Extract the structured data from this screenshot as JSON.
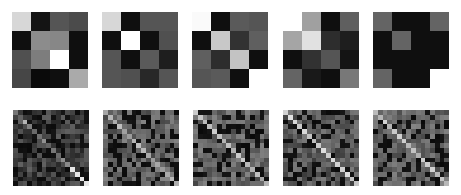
{
  "figure": {
    "background": "#ffffff",
    "colormap": "grayscale (0=black, 255=white)"
  },
  "chart_data": [
    {
      "type": "heatmap",
      "row": "top",
      "index": 0,
      "size": 4,
      "values": [
        [
          215,
          20,
          85,
          75
        ],
        [
          15,
          140,
          135,
          15
        ],
        [
          80,
          125,
          255,
          15
        ],
        [
          70,
          10,
          15,
          170
        ]
      ]
    },
    {
      "type": "heatmap",
      "row": "top",
      "index": 1,
      "size": 4,
      "values": [
        [
          215,
          15,
          85,
          85
        ],
        [
          15,
          255,
          15,
          80
        ],
        [
          85,
          15,
          90,
          30
        ],
        [
          85,
          80,
          40,
          85
        ]
      ]
    },
    {
      "type": "heatmap",
      "row": "top",
      "index": 2,
      "size": 4,
      "values": [
        [
          250,
          15,
          90,
          85
        ],
        [
          15,
          200,
          50,
          95
        ],
        [
          95,
          45,
          195,
          15
        ],
        [
          85,
          90,
          15,
          255
        ]
      ]
    },
    {
      "type": "heatmap",
      "row": "top",
      "index": 3,
      "size": 4,
      "values": [
        [
          255,
          160,
          15,
          95
        ],
        [
          165,
          225,
          45,
          30
        ],
        [
          15,
          50,
          85,
          20
        ],
        [
          100,
          25,
          15,
          120
        ]
      ]
    },
    {
      "type": "heatmap",
      "row": "top",
      "index": 4,
      "size": 4,
      "values": [
        [
          100,
          15,
          15,
          100
        ],
        [
          15,
          100,
          15,
          15
        ],
        [
          15,
          15,
          15,
          15
        ],
        [
          100,
          15,
          15,
          255
        ]
      ]
    },
    {
      "type": "heatmap",
      "row": "bottom",
      "index": 0,
      "size": 16,
      "diagonal_brightness": "weak-to-strong toward bottom-right"
    },
    {
      "type": "heatmap",
      "row": "bottom",
      "index": 1,
      "size": 16,
      "diagonal_brightness": "moderate"
    },
    {
      "type": "heatmap",
      "row": "bottom",
      "index": 2,
      "size": 16,
      "diagonal_brightness": "moderate"
    },
    {
      "type": "heatmap",
      "row": "bottom",
      "index": 3,
      "size": 16,
      "diagonal_brightness": "strong"
    },
    {
      "type": "heatmap",
      "row": "bottom",
      "index": 4,
      "size": 16,
      "diagonal_brightness": "strong"
    }
  ],
  "layout": {
    "top": {
      "y": 12,
      "size": 76,
      "xs": [
        12,
        102,
        192,
        283,
        373
      ]
    },
    "bottom": {
      "y": 110,
      "size": 76,
      "xs": [
        13,
        103,
        193,
        283,
        373
      ],
      "grid": 16,
      "diag": [
        150,
        195,
        205,
        225,
        215
      ],
      "noise_seed": [
        7,
        13,
        21,
        29,
        37
      ],
      "base": [
        35,
        70,
        70,
        60,
        70
      ]
    }
  }
}
